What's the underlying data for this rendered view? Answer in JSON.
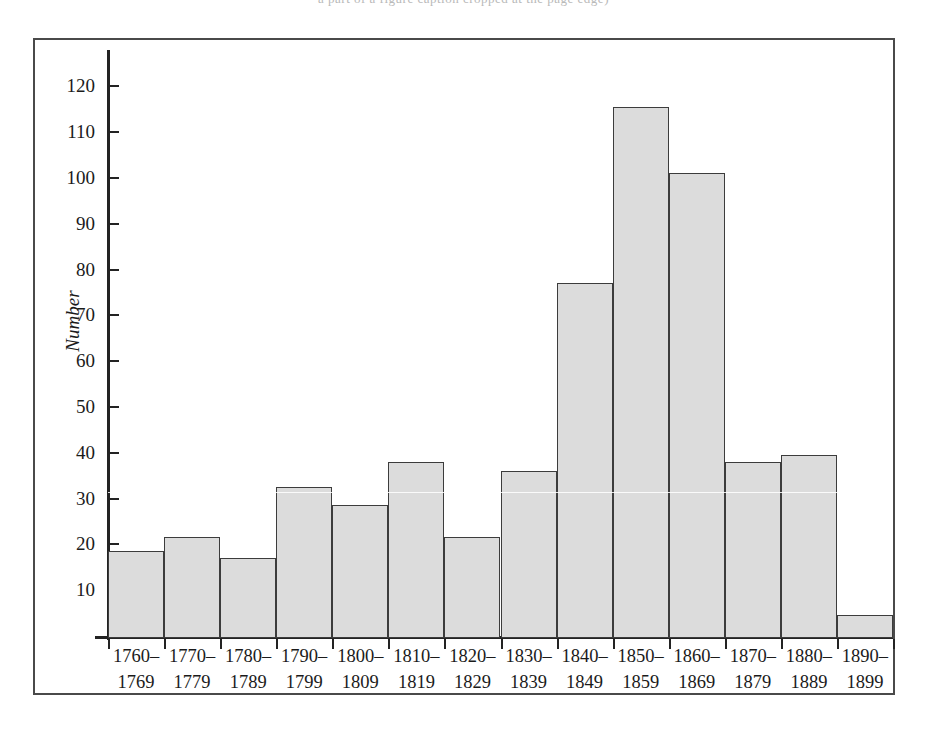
{
  "page": {
    "top_running_text": "a part of a figure caption cropped at the page edge)"
  },
  "figure": {
    "axis_title_y": "Number"
  },
  "chart_data": {
    "type": "bar",
    "title": "",
    "subtitle": "",
    "xlabel": "",
    "ylabel": "Number",
    "ylim": [
      0,
      125
    ],
    "ytick_step": 10,
    "grid": false,
    "legend": null,
    "bar_fill_color": "#dcdcdc",
    "bar_edge_color": "#3c3c3c",
    "axis_color": "#232323",
    "frame_color": "#4a4a4a",
    "categories": [
      "1760–\n1769",
      "1770–\n1779",
      "1780–\n1789",
      "1790–\n1799",
      "1800–\n1809",
      "1810–\n1819",
      "1820–\n1829",
      "1830–\n1839",
      "1840–\n1849",
      "1850–\n1859",
      "1860–\n1869",
      "1870–\n1879",
      "1880–\n1889",
      "1890–\n1899"
    ],
    "category_lines": [
      [
        "1760–",
        "1769"
      ],
      [
        "1770–",
        "1779"
      ],
      [
        "1780–",
        "1789"
      ],
      [
        "1790–",
        "1799"
      ],
      [
        "1800–",
        "1809"
      ],
      [
        "1810–",
        "1819"
      ],
      [
        "1820–",
        "1829"
      ],
      [
        "1830–",
        "1839"
      ],
      [
        "1840–",
        "1849"
      ],
      [
        "1850–",
        "1859"
      ],
      [
        "1860–",
        "1869"
      ],
      [
        "1870–",
        "1879"
      ],
      [
        "1880–",
        "1889"
      ],
      [
        "1890–",
        "1899"
      ]
    ],
    "values": [
      19,
      22,
      17.5,
      33,
      29,
      38.5,
      22,
      36.5,
      77.5,
      116,
      101.5,
      38.5,
      40,
      5
    ],
    "ytick_labels": [
      "10",
      "20",
      "30",
      "40",
      "50",
      "60",
      "70",
      "80",
      "90",
      "100",
      "110",
      "120"
    ],
    "ytick_values": [
      10,
      20,
      30,
      40,
      50,
      60,
      70,
      80,
      90,
      100,
      110,
      120
    ]
  }
}
